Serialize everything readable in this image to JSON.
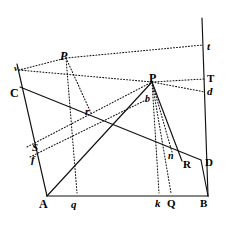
{
  "figure": {
    "background_color": "#ffffff",
    "ink_color": "#111111",
    "width": 229,
    "height": 234,
    "labels": [
      {
        "name": "label-t",
        "text": "t",
        "x": 207,
        "y": 41,
        "style": "ital",
        "size": 11
      },
      {
        "name": "label-P-upper",
        "text": "P",
        "x": 60,
        "y": 50,
        "style": "ital",
        "size": 12
      },
      {
        "name": "label-T",
        "text": "T",
        "x": 207,
        "y": 73,
        "style": "bold",
        "size": 11
      },
      {
        "name": "label-P-right",
        "text": "P",
        "x": 149,
        "y": 72,
        "style": "bold",
        "size": 12
      },
      {
        "name": "label-d",
        "text": "d",
        "x": 207,
        "y": 86,
        "style": "ital",
        "size": 11
      },
      {
        "name": "label-v",
        "text": "v",
        "x": 14,
        "y": 64,
        "style": "ital",
        "size": 9
      },
      {
        "name": "label-C",
        "text": "C",
        "x": 10,
        "y": 87,
        "style": "bold",
        "size": 12
      },
      {
        "name": "label-b",
        "text": "b",
        "x": 145,
        "y": 94,
        "style": "ital",
        "size": 10
      },
      {
        "name": "label-r",
        "text": "r",
        "x": 85,
        "y": 106,
        "style": "ital",
        "size": 11
      },
      {
        "name": "label-S",
        "text": "S",
        "x": 32,
        "y": 142,
        "style": "ital",
        "size": 11
      },
      {
        "name": "label-f",
        "text": "f",
        "x": 31,
        "y": 154,
        "style": "ital",
        "size": 11
      },
      {
        "name": "label-n",
        "text": "n",
        "x": 168,
        "y": 151,
        "style": "ital",
        "size": 10
      },
      {
        "name": "label-R",
        "text": "R",
        "x": 183,
        "y": 159,
        "style": "bold",
        "size": 11
      },
      {
        "name": "label-D",
        "text": "D",
        "x": 205,
        "y": 157,
        "style": "bold",
        "size": 11
      },
      {
        "name": "label-A",
        "text": "A",
        "x": 39,
        "y": 198,
        "style": "bold",
        "size": 12
      },
      {
        "name": "label-q",
        "text": "q",
        "x": 71,
        "y": 199,
        "style": "ital",
        "size": 11
      },
      {
        "name": "label-k",
        "text": "k",
        "x": 155,
        "y": 198,
        "style": "ital",
        "size": 11
      },
      {
        "name": "label-Q",
        "text": "Q",
        "x": 167,
        "y": 198,
        "style": "bold",
        "size": 11
      },
      {
        "name": "label-B",
        "text": "B",
        "x": 200,
        "y": 198,
        "style": "bold",
        "size": 11
      }
    ],
    "points": {
      "A": [
        47,
        196
      ],
      "B": [
        208,
        196
      ],
      "C": [
        20,
        87
      ],
      "D": [
        201,
        160
      ],
      "R": [
        182,
        161
      ],
      "Q": [
        171,
        193
      ],
      "k": [
        159,
        193
      ],
      "n": [
        172,
        152
      ],
      "S": [
        27,
        147
      ],
      "f": [
        30,
        157
      ],
      "P_right": [
        152,
        82
      ],
      "P_upper": [
        66,
        58
      ],
      "b": [
        146,
        100
      ],
      "r": [
        91,
        113
      ],
      "q": [
        77,
        193
      ],
      "v": [
        19,
        70
      ],
      "t": [
        203,
        45
      ],
      "T": [
        204,
        79
      ],
      "d": [
        205,
        92
      ],
      "top_right": [
        202,
        18
      ],
      "left_top": [
        17,
        64
      ]
    },
    "solid_edges": [
      {
        "name": "edge-A-B-baseline",
        "from": "A",
        "to": "B"
      },
      {
        "name": "edge-left-top-to-A",
        "from": "left_top",
        "to": "A"
      },
      {
        "name": "edge-C-to-D",
        "from": "C",
        "to": "D"
      },
      {
        "name": "edge-A-to-P-right",
        "from": "A",
        "to": "P_right"
      },
      {
        "name": "edge-P-right-to-R",
        "from": "P_right",
        "to": "R"
      },
      {
        "name": "edge-right-vertical",
        "from": "top_right",
        "to": "B"
      },
      {
        "name": "edge-D-to-B",
        "from": "D",
        "to": "B"
      }
    ],
    "dotted_edges": [
      {
        "name": "dotted-P-upper-to-t",
        "from": "P_upper",
        "to": "t"
      },
      {
        "name": "dotted-P-upper-to-v",
        "from": "P_upper",
        "to": "v"
      },
      {
        "name": "dotted-P-upper-to-r",
        "from": "P_upper",
        "to": "r"
      },
      {
        "name": "dotted-P-upper-to-q",
        "from": "P_upper",
        "to": "q"
      },
      {
        "name": "dotted-P-right-to-T",
        "from": "P_right",
        "to": "T"
      },
      {
        "name": "dotted-P-right-to-d",
        "from": "P_right",
        "to": "d"
      },
      {
        "name": "dotted-P-right-to-k",
        "from": "P_right",
        "to": "k"
      },
      {
        "name": "dotted-P-right-to-Q",
        "from": "P_right",
        "to": "Q"
      },
      {
        "name": "dotted-P-right-to-n",
        "from": "P_right",
        "to": "n"
      },
      {
        "name": "dotted-S-to-P-right",
        "from": "S",
        "to": "P_right"
      },
      {
        "name": "dotted-f-to-b",
        "from": "f",
        "to": "b"
      },
      {
        "name": "dotted-v-to-P-right",
        "from": "v",
        "to": "P_right"
      }
    ]
  }
}
